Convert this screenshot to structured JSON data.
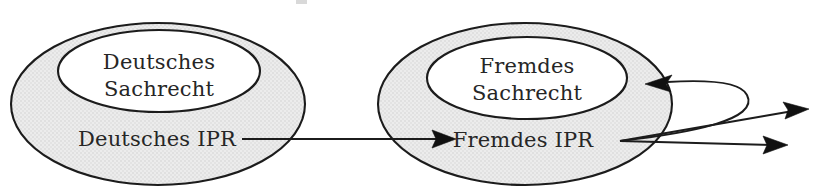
{
  "diagram": {
    "type": "set-containment-diagram",
    "background_color": "#ffffff",
    "stroke_color": "#1c1c1c",
    "ring_fill_color": "#e9e9e9",
    "inner_fill_color": "#ffffff",
    "text_color": "#262626",
    "nodes": [
      {
        "id": "deutsches-ipr",
        "ring_label": "Deutsches IPR",
        "inner_label_line1": "Deutsches",
        "inner_label_line2": "Sachrecht",
        "inner_label": "Deutsches Sachrecht"
      },
      {
        "id": "fremdes-ipr",
        "ring_label": "Fremdes IPR",
        "inner_label_line1": "Fremdes",
        "inner_label_line2": "Sachrecht",
        "inner_label": "Fremdes Sachrecht"
      }
    ],
    "edges": [
      {
        "id": "edge-deutsches-ipr-to-fremdes-ipr",
        "from": "deutsches-ipr",
        "to": "fremdes-ipr",
        "style": "straight",
        "direction": "left-to-right"
      },
      {
        "id": "edge-fremdes-ipr-to-fremdes-sachrecht",
        "from": "fremdes-ipr",
        "to": "fremdes-sachrecht",
        "style": "loop-back-curve",
        "direction": "right-then-back-left"
      },
      {
        "id": "edge-fremdes-ipr-outbound-upper",
        "from": "fremdes-ipr",
        "to": "external-upper",
        "style": "straight",
        "direction": "right-upward"
      },
      {
        "id": "edge-fremdes-ipr-outbound-lower",
        "from": "fremdes-ipr",
        "to": "external-lower",
        "style": "straight",
        "direction": "right-downward"
      }
    ]
  }
}
